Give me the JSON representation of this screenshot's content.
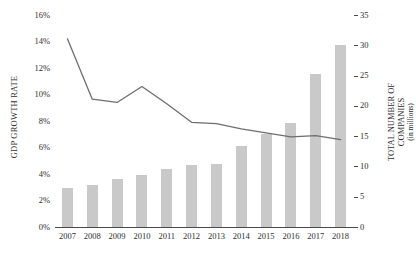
{
  "chart_data": {
    "type": "bar",
    "title": "",
    "subtitle": "",
    "xlabel": "",
    "categories": [
      "2007",
      "2008",
      "2009",
      "2010",
      "2011",
      "2012",
      "2013",
      "2014",
      "2015",
      "2016",
      "2017",
      "2018"
    ],
    "grid": false,
    "legend_position": "none",
    "axes": {
      "left": {
        "label": "GDP GROWTH RATE",
        "ticks": [
          "0%",
          "2%",
          "4%",
          "6%",
          "8%",
          "10%",
          "12%",
          "14%",
          "16%"
        ],
        "tick_values": [
          0,
          2,
          4,
          6,
          8,
          10,
          12,
          14,
          16
        ],
        "min": 0,
        "max": 16,
        "unit": "%"
      },
      "right": {
        "label": "TOTAL NUMBER OF COMPANIES",
        "label_sub": "(in millions)",
        "ticks": [
          "0",
          "5",
          "10",
          "15",
          "20",
          "25",
          "30",
          "35"
        ],
        "tick_values": [
          0,
          5,
          10,
          15,
          20,
          25,
          30,
          35
        ],
        "min": 0,
        "max": 35,
        "unit": "millions"
      }
    },
    "series": [
      {
        "name": "TOTAL NUMBER OF COMPANIES",
        "type": "bar",
        "axis": "right",
        "color": "#c9c9c9",
        "values": [
          6.5,
          7.0,
          8.0,
          8.6,
          9.5,
          10.3,
          10.4,
          13.4,
          15.3,
          17.1,
          25.3,
          30.0
        ]
      },
      {
        "name": "GDP GROWTH RATE",
        "type": "line",
        "axis": "left",
        "color": "#6e6e6e",
        "values": [
          14.2,
          9.65,
          9.4,
          10.6,
          9.3,
          7.9,
          7.8,
          7.4,
          7.1,
          6.8,
          6.9,
          6.6
        ]
      }
    ]
  }
}
